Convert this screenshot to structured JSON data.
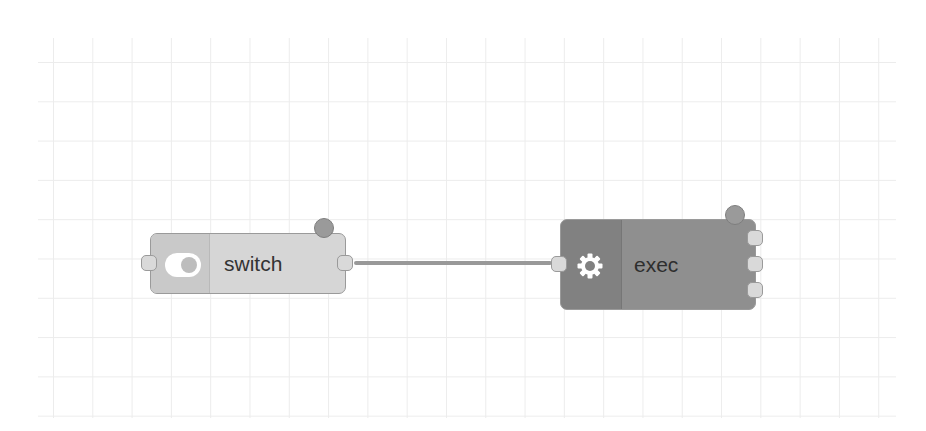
{
  "canvas": {
    "background": "#ffffff",
    "grid_color": "#ececec",
    "grid_spacing_px": 39
  },
  "nodes": [
    {
      "id": "switch",
      "label": "switch",
      "icon": "toggle-icon",
      "color": "#d6d6d6",
      "inputs": 1,
      "outputs": 1,
      "has_status_dot": true
    },
    {
      "id": "exec",
      "label": "exec",
      "icon": "gear-icon",
      "color": "#8f8f8f",
      "inputs": 1,
      "outputs": 3,
      "has_status_dot": true
    }
  ],
  "wires": [
    {
      "from": "switch",
      "from_port": 0,
      "to": "exec",
      "to_port": 0
    }
  ]
}
